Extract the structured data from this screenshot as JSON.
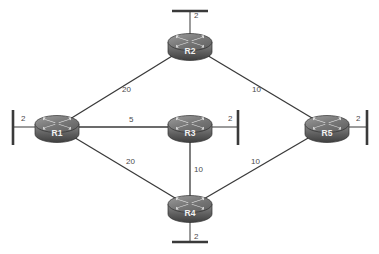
{
  "diagram": {
    "type": "network-topology",
    "background_color": "#ffffff",
    "line_color": "#3a3a3a",
    "label_color": "#4a4a4a",
    "router_label_color": "#f2f2f2",
    "routers": [
      {
        "id": "R1",
        "label": "R1",
        "x": 57,
        "y": 127
      },
      {
        "id": "R2",
        "label": "R2",
        "x": 190,
        "y": 45
      },
      {
        "id": "R3",
        "label": "R3",
        "x": 190,
        "y": 127
      },
      {
        "id": "R4",
        "label": "R4",
        "x": 190,
        "y": 207
      },
      {
        "id": "R5",
        "label": "R5",
        "x": 327,
        "y": 127
      }
    ],
    "links": [
      {
        "from": "R1",
        "to": "R2",
        "cost": "20",
        "label_x": 122,
        "label_y": 92
      },
      {
        "from": "R2",
        "to": "R5",
        "cost": "10",
        "label_x": 252,
        "label_y": 92
      },
      {
        "from": "R1",
        "to": "R3",
        "cost": "5",
        "label_x": 129,
        "label_y": 122
      },
      {
        "from": "R1",
        "to": "R4",
        "cost": "20",
        "label_x": 126,
        "label_y": 164
      },
      {
        "from": "R3",
        "to": "R4",
        "cost": "10",
        "label_x": 194,
        "label_y": 172
      },
      {
        "from": "R4",
        "to": "R5",
        "cost": "10",
        "label_x": 251,
        "label_y": 164
      }
    ],
    "lan_segments": [
      {
        "router": "R2",
        "side": "top",
        "cost": "2",
        "label_x": 194,
        "label_y": 18
      },
      {
        "router": "R1",
        "side": "left",
        "cost": "2",
        "label_x": 21,
        "label_y": 121
      },
      {
        "router": "R3",
        "side": "right",
        "cost": "2",
        "label_x": 228,
        "label_y": 121
      },
      {
        "router": "R5",
        "side": "right",
        "cost": "2",
        "label_x": 356,
        "label_y": 121
      },
      {
        "router": "R4",
        "side": "bottom",
        "cost": "2",
        "label_x": 194,
        "label_y": 239
      }
    ]
  }
}
